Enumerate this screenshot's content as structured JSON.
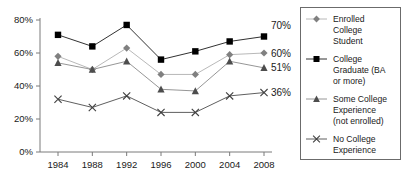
{
  "chart_data": {
    "type": "line",
    "title": "",
    "xlabel": "",
    "ylabel": "",
    "categories": [
      "1984",
      "1988",
      "1992",
      "1996",
      "2000",
      "2004",
      "2008"
    ],
    "ylim": [
      0,
      80
    ],
    "yticks": [
      "0%",
      "20%",
      "40%",
      "60%",
      "80%"
    ],
    "ytick_values": [
      0,
      20,
      40,
      60,
      80
    ],
    "grid": false,
    "legend_position": "right",
    "series": [
      {
        "name": "Enrolled College Student",
        "marker": "diamond",
        "color": "#808080",
        "line_color": "#b0b0b0",
        "values": [
          58,
          50,
          63,
          47,
          47,
          59,
          60
        ],
        "end_label": "60%"
      },
      {
        "name": "College Graduate (BA or more)",
        "marker": "square",
        "color": "#000000",
        "line_color": "#1a1a1a",
        "values": [
          71,
          64,
          77,
          56,
          61,
          67,
          70
        ],
        "end_label": "70%"
      },
      {
        "name": "Some College Experience (not enrolled)",
        "marker": "triangle",
        "color": "#4d4d4d",
        "line_color": "#8a8a8a",
        "values": [
          54,
          50,
          55,
          38,
          37,
          55,
          51
        ],
        "end_label": "51%"
      },
      {
        "name": "No College Experience",
        "marker": "cross",
        "color": "#404040",
        "line_color": "#4d4d4d",
        "values": [
          32,
          27,
          34,
          24,
          24,
          34,
          36
        ],
        "end_label": "36%"
      }
    ]
  },
  "legend": {
    "items": [
      {
        "lines": [
          "Enrolled",
          "College",
          "Student"
        ]
      },
      {
        "lines": [
          "College",
          "Graduate (BA",
          "or more)"
        ]
      },
      {
        "lines": [
          "Some College",
          "Experience",
          "(not enrolled)"
        ]
      },
      {
        "lines": [
          "No College",
          "Experience"
        ]
      }
    ]
  }
}
